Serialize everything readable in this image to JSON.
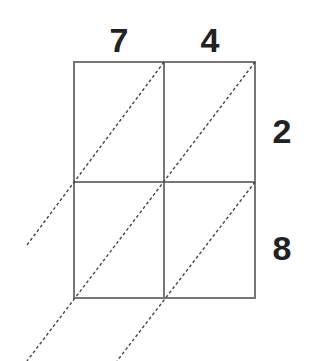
{
  "diagram": {
    "type": "lattice-multiplication-grid",
    "top_digits": [
      "7",
      "4"
    ],
    "right_digits": [
      "2",
      "8"
    ],
    "grid": {
      "rows": 2,
      "cols": 2,
      "left": 74,
      "top": 62,
      "right": 255,
      "bottom": 298,
      "col_split": 164,
      "row_split": 182,
      "line_color": "#777777"
    },
    "diagonals": {
      "color": "#444444",
      "style": "dashed",
      "lines": [
        {
          "from": [
            164,
            62
          ],
          "to": [
            27,
            245
          ]
        },
        {
          "from": [
            255,
            62
          ],
          "to": [
            27,
            361
          ]
        },
        {
          "from": [
            255,
            182
          ],
          "to": [
            117,
            361
          ]
        }
      ]
    },
    "text_color": "#222222"
  }
}
